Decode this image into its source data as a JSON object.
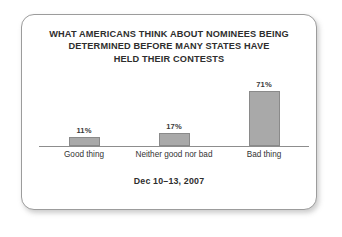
{
  "chart_data": {
    "type": "bar",
    "title": "WHAT AMERICANS THINK ABOUT NOMINEES BEING DETERMINED BEFORE MANY STATES HAVE HELD THEIR CONTESTS",
    "title_lines": [
      "WHAT AMERICANS THINK ABOUT NOMINEES BEING",
      "DETERMINED BEFORE MANY STATES HAVE",
      "HELD THEIR CONTESTS"
    ],
    "categories": [
      "Good thing",
      "Neither good nor bad",
      "Bad thing"
    ],
    "values": [
      11,
      17,
      71
    ],
    "value_labels": [
      "11%",
      "17%",
      "71%"
    ],
    "xlabel": "",
    "ylabel": "",
    "ylim": [
      0,
      100
    ],
    "grid": false,
    "legend": false,
    "footnote": "Dec 10–13, 2007",
    "bar_color": "#a9a9a9",
    "bar_border_color": "#8a8a8a",
    "axis_color": "#8d8d8d",
    "text_color": "#2e2e2e"
  }
}
